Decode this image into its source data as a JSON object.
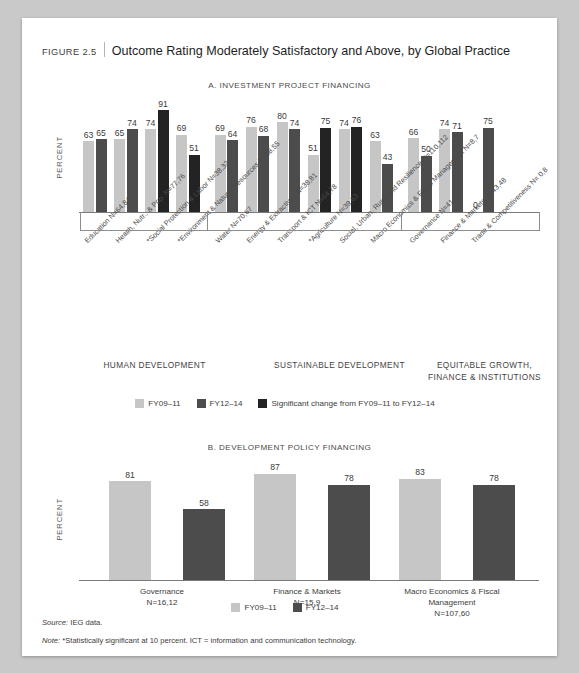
{
  "figure": {
    "number": "FIGURE 2.5",
    "title": "Outcome Rating Moderately Satisfactory and Above, by Global Practice"
  },
  "panelA": {
    "heading": "A. INVESTMENT PROJECT FINANCING",
    "ylabel": "PERCENT"
  },
  "panelB": {
    "heading": "B. DEVELOPMENT POLICY FINANCING",
    "ylabel": "PERCENT"
  },
  "legendA": {
    "fy0911": "FY09–11",
    "fy1214": "FY12–14",
    "significant": "Significant change from FY09–11 to FY12–14"
  },
  "legendB": {
    "fy0911": "FY09–11",
    "fy1214": "FY12–14"
  },
  "groups": [
    {
      "caption": "HUMAN DEVELOPMENT"
    },
    {
      "caption": "SUSTAINABLE DEVELOPMENT"
    },
    {
      "caption": "EQUITABLE GROWTH,\nFINANCE & INSTITUTIONS"
    }
  ],
  "footnotes": {
    "source_label": "Source:",
    "source_text": " IEG data.",
    "note_label": "Note:",
    "note_text": " *Statistically significant at 10 percent. ICT = information and communication technology."
  },
  "colors": {
    "fy0911": "#c6c6c6",
    "fy1214": "#4c4c4c",
    "significant": "#232323",
    "axis": "#7b7b7b",
    "page": "#ffffff",
    "backdrop": "#c9c9c9"
  },
  "chart_data": [
    {
      "type": "bar",
      "title": "A. INVESTMENT PROJECT FINANCING",
      "xlabel": "",
      "ylabel": "PERCENT",
      "ylim": [
        0,
        100
      ],
      "grid": false,
      "legend_position": "bottom",
      "categories": [
        "Education N=64,84",
        "Health, Nutr., & Pop. N=77,76",
        "*Social Protection & Labor N=38,32",
        "*Environment & Natural Resources N=58,55",
        "Water N=70,67",
        "Energy & Extractives N=38,81",
        "Transport & ICT N=64,78",
        "*Agriculture N=39,63",
        "Social, Urban, Rural and Resilience N=110,112",
        "Macro Economics & Fiscal Management N=8,7",
        "Governance N=41,54",
        "Finance & Markets N=43,48",
        "Trade & Competitiveness N= 0,8"
      ],
      "series": [
        {
          "name": "FY09–11",
          "values": [
            63,
            65,
            74,
            69,
            69,
            76,
            80,
            51,
            74,
            63,
            66,
            74,
            0
          ]
        },
        {
          "name": "FY12–14",
          "values": [
            65,
            74,
            91,
            51,
            64,
            68,
            74,
            75,
            76,
            43,
            50,
            71,
            75
          ]
        }
      ],
      "significant_change": [
        false,
        false,
        true,
        true,
        false,
        false,
        false,
        true,
        true,
        false,
        false,
        false,
        false
      ],
      "group_captions": [
        "HUMAN DEVELOPMENT",
        "SUSTAINABLE DEVELOPMENT",
        "EQUITABLE GROWTH, FINANCE & INSTITUTIONS"
      ]
    },
    {
      "type": "bar",
      "title": "B. DEVELOPMENT POLICY FINANCING",
      "xlabel": "",
      "ylabel": "PERCENT",
      "ylim": [
        0,
        100
      ],
      "grid": false,
      "legend_position": "bottom",
      "categories": [
        "Governance\nN=16,12",
        "Finance & Markets\nN=15,9",
        "Macro Economics & Fiscal\nManagement\nN=107,60"
      ],
      "series": [
        {
          "name": "FY09–11",
          "values": [
            81,
            87,
            83
          ]
        },
        {
          "name": "FY12–14",
          "values": [
            58,
            78,
            78
          ]
        }
      ]
    }
  ],
  "tickLabels": [
    "Education N=64,84",
    "Health, Nutr., & Pop. N=77,76",
    "*Social Protection & Labor N=38,32",
    "*Environment & Natural Resources N=58,55",
    "Water N=70,67",
    "Energy & Extractives N=38,81",
    "Transport & ICT N=64,78",
    "*Agriculture N=39,63",
    "Social, Urban, Rural and Resilience N=110,112",
    "Macro Economics & Fiscal Management N=8,7",
    "Governance N=41,54",
    "Finance & Markets N=43,48",
    "Trade & Competitiveness N= 0,8"
  ],
  "panelBCaptions": [
    {
      "l1": "Governance",
      "l2": "N=16,12",
      "l3": ""
    },
    {
      "l1": "Finance & Markets",
      "l2": "N=15,9",
      "l3": ""
    },
    {
      "l1": "Macro Economics & Fiscal",
      "l2": "Management",
      "l3": "N=107,60"
    }
  ]
}
